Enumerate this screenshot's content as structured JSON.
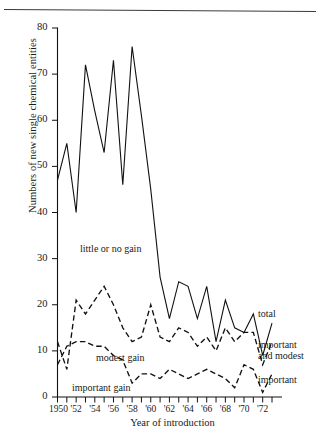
{
  "chart_data": {
    "type": "line",
    "title": "",
    "xlabel": "Year of introduction",
    "ylabel": "Numbers of new single chemical entities",
    "xlim": [
      1950,
      1973
    ],
    "ylim": [
      0,
      80
    ],
    "grid": false,
    "legend_position": "right-inline",
    "y_ticks": [
      0,
      10,
      20,
      30,
      40,
      50,
      60,
      70,
      80
    ],
    "y_tick_labels": [
      "0",
      "10",
      "20",
      "30",
      "40",
      "50",
      "60",
      "70",
      "80"
    ],
    "x_ticks": [
      1950,
      1951,
      1952,
      1953,
      1954,
      1955,
      1956,
      1957,
      1958,
      1959,
      1960,
      1961,
      1962,
      1963,
      1964,
      1965,
      1966,
      1967,
      1968,
      1969,
      1970,
      1971,
      1972,
      1973
    ],
    "x_tick_labels": [
      "1950",
      "'52",
      "'54",
      "'56",
      "'58",
      "'60",
      "'62",
      "'64",
      "'66",
      "'68",
      "'70",
      "'72"
    ],
    "x_labeled_years": [
      1950,
      1952,
      1954,
      1956,
      1958,
      1960,
      1962,
      1964,
      1966,
      1968,
      1970,
      1972
    ],
    "x": [
      1950,
      1951,
      1952,
      1953,
      1954,
      1955,
      1956,
      1957,
      1958,
      1959,
      1960,
      1961,
      1962,
      1963,
      1964,
      1965,
      1966,
      1967,
      1968,
      1969,
      1970,
      1971,
      1972,
      1973
    ],
    "series": [
      {
        "name": "total",
        "style": "solid",
        "values": [
          47,
          55,
          40,
          72,
          62,
          53,
          73,
          46,
          76,
          61,
          45,
          26,
          17,
          25,
          24,
          17,
          24,
          12,
          21,
          15,
          14,
          18,
          9,
          16
        ]
      },
      {
        "name": "important and modest",
        "style": "dashed",
        "values": [
          12,
          6,
          21,
          18,
          21,
          24,
          20,
          15,
          12,
          13,
          20,
          13,
          12,
          15,
          14,
          11,
          13,
          10,
          15,
          12,
          14,
          14,
          7,
          12
        ]
      },
      {
        "name": "important",
        "style": "dashed",
        "values": [
          7,
          11,
          12,
          12,
          11,
          11,
          9,
          8,
          3,
          5,
          5,
          4,
          6,
          5,
          4,
          5,
          6,
          5,
          4,
          2,
          7,
          6,
          1,
          5
        ]
      }
    ],
    "annotations": [
      {
        "text": "little or no gain",
        "x_px": 80,
        "y_px": 243
      },
      {
        "text": "modest gain",
        "x_px": 96,
        "y_px": 352
      },
      {
        "text": "important gain",
        "x_px": 72,
        "y_px": 382
      }
    ],
    "legend_labels": [
      {
        "text": "total",
        "x_px": 258,
        "y_px": 308
      },
      {
        "text": "important",
        "x_px": 258,
        "y_px": 339
      },
      {
        "text": "and modest",
        "x_px": 258,
        "y_px": 350
      },
      {
        "text": "important",
        "x_px": 258,
        "y_px": 374
      }
    ],
    "colors": {
      "line": "#111111",
      "background": "#ffffff",
      "text": "#1a1a1a"
    }
  }
}
